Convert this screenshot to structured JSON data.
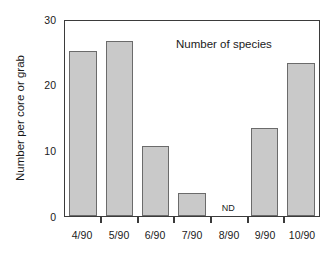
{
  "chart_data": {
    "type": "bar",
    "title": "",
    "annotation": "Number of species",
    "xlabel": "",
    "ylabel": "Number per core or grab",
    "categories": [
      "4/90",
      "5/90",
      "6/90",
      "7/90",
      "8/90",
      "9/90",
      "10/90"
    ],
    "values": [
      25.4,
      27.0,
      10.8,
      3.5,
      null,
      13.6,
      23.6
    ],
    "value_notes": [
      "",
      "",
      "",
      "",
      "ND",
      "",
      ""
    ],
    "no_data_label": "ND",
    "ylim": [
      0,
      30
    ],
    "ytick_labels": [
      "0",
      "10",
      "20",
      "30"
    ],
    "ytick_values": [
      0,
      10,
      20,
      30
    ],
    "yminor_values": [
      5,
      15,
      25
    ],
    "grid": false,
    "legend": "none",
    "colors": {
      "bar_fill": "#c9c9c9",
      "bar_edge": "#6b6b6b",
      "axis": "#3b3b3b",
      "text": "#1a1a1a",
      "background": "#ffffff"
    }
  }
}
